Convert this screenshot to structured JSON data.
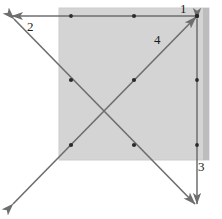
{
  "figure": {
    "canvas": {
      "width": 222,
      "height": 219,
      "background": "#ffffff"
    },
    "colors": {
      "square_fill": "#d4d4d4",
      "square_fill_right_band": "#bdbdbd",
      "square_stroke": "#cfcfcf",
      "line_stroke": "#6e6e6e",
      "line_stroke_dark": "#5f5f5f",
      "dot_fill": "#2b2b2b",
      "label_color": "#1b1b1b"
    },
    "square": {
      "x": 59,
      "y": 8,
      "width": 150,
      "height": 152
    },
    "labels": [
      {
        "id": "label-1",
        "text": "1",
        "x": 180,
        "y": 2
      },
      {
        "id": "label-2",
        "text": "2",
        "x": 27,
        "y": 20
      },
      {
        "id": "label-3",
        "text": "3",
        "x": 198,
        "y": 160
      },
      {
        "id": "label-4",
        "text": "4",
        "x": 154,
        "y": 33
      }
    ],
    "lines": [
      {
        "id": "line-1",
        "label": "1",
        "description": "horizontal line across top of square, arrowhead at left end",
        "x1": 197,
        "y1": 16,
        "x2": 11,
        "y2": 16,
        "arrow_at": "end"
      },
      {
        "id": "line-2",
        "label": "2",
        "description": "diagonal from top-left down to bottom-right, arrowheads both ends",
        "x1": 14,
        "y1": 19,
        "x2": 195,
        "y2": 204,
        "arrow_at": "both"
      },
      {
        "id": "line-3",
        "label": "3",
        "description": "vertical line on right side, arrowheads both ends",
        "x1": 197,
        "y1": 18,
        "x2": 197,
        "y2": 205,
        "arrow_at": "both"
      },
      {
        "id": "line-4",
        "label": "4",
        "description": "diagonal from bottom-left up to top-right corner, arrowheads both ends",
        "x1": 13,
        "y1": 204,
        "x2": 196,
        "y2": 17,
        "arrow_at": "both"
      }
    ],
    "points": [
      {
        "id": "point-top-left-mid",
        "x": 71,
        "y": 16
      },
      {
        "id": "point-top-center",
        "x": 134,
        "y": 16
      },
      {
        "id": "point-top-right-corner",
        "x": 197,
        "y": 16
      },
      {
        "id": "point-diag-upper-left",
        "x": 71,
        "y": 80
      },
      {
        "id": "point-diag-upper-right",
        "x": 134,
        "y": 80
      },
      {
        "id": "point-right-upper",
        "x": 197,
        "y": 80
      },
      {
        "id": "point-diag-lower-left",
        "x": 71,
        "y": 145
      },
      {
        "id": "point-diag-lower-right",
        "x": 134,
        "y": 145
      },
      {
        "id": "point-right-lower",
        "x": 197,
        "y": 145
      }
    ]
  }
}
